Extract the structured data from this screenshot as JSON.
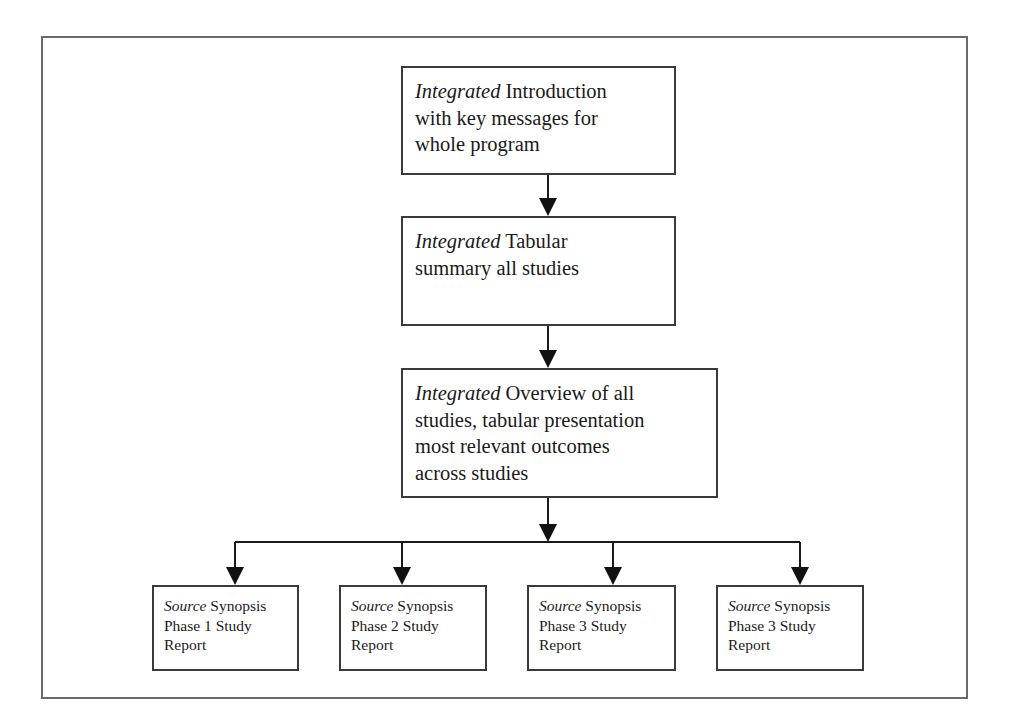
{
  "diagram": {
    "type": "flowchart",
    "nodes": [
      {
        "id": "intro",
        "prefix": "Integrated",
        "line1": " Introduction",
        "line2": "with key messages for",
        "line3": "whole program"
      },
      {
        "id": "tabular",
        "prefix": "Integrated",
        "line1": " Tabular",
        "line2": "summary all studies"
      },
      {
        "id": "overview",
        "prefix": "Integrated",
        "line1": " Overview of all",
        "line2": "studies, tabular presentation",
        "line3": "most relevant outcomes",
        "line4": "across studies"
      },
      {
        "id": "phase1",
        "prefix": "Source",
        "line1": " Synopsis",
        "line2": "Phase 1 Study",
        "line3": "Report"
      },
      {
        "id": "phase2",
        "prefix": "Source",
        "line1": " Synopsis",
        "line2": "Phase 2 Study",
        "line3": "Report"
      },
      {
        "id": "phase3a",
        "prefix": "Source",
        "line1": " Synopsis",
        "line2": "Phase 3 Study",
        "line3": "Report"
      },
      {
        "id": "phase3b",
        "prefix": "Source",
        "line1": " Synopsis",
        "line2": "Phase 3 Study",
        "line3": "Report"
      }
    ],
    "edges": [
      {
        "from": "intro",
        "to": "tabular"
      },
      {
        "from": "tabular",
        "to": "overview"
      },
      {
        "from": "overview",
        "to": "phase1"
      },
      {
        "from": "overview",
        "to": "phase2"
      },
      {
        "from": "overview",
        "to": "phase3a"
      },
      {
        "from": "overview",
        "to": "phase3b"
      }
    ],
    "colors": {
      "stroke": "#3a3a3a",
      "frame": "#6a6a6a",
      "background": "#ffffff"
    }
  }
}
